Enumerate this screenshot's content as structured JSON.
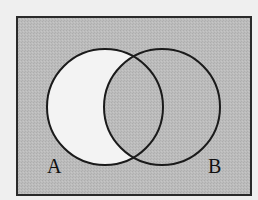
{
  "diagram": {
    "type": "venn",
    "shaded_region": "complement of (A minus B)",
    "unshaded_region": "A minus B",
    "sets": [
      {
        "label": "A",
        "cx": 105,
        "cy": 107,
        "r": 58
      },
      {
        "label": "B",
        "cx": 162,
        "cy": 107,
        "r": 58
      }
    ],
    "universe_box": {
      "x": 17,
      "y": 17,
      "width": 234,
      "height": 178
    },
    "colors": {
      "shade": "#b9b9b9",
      "unshaded": "#f3f3f3",
      "outline": "#1a1a1a",
      "background": "#efefef"
    }
  }
}
